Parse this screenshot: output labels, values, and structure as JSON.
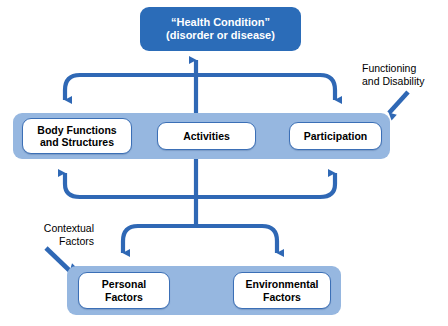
{
  "diagram": {
    "title_box": {
      "line1": "“Health Condition”",
      "line2": "(disorder or disease)"
    },
    "middle_band": {
      "nodes": [
        {
          "line1": "Body Functions",
          "line2": "and Structures"
        },
        {
          "line1": "Activities",
          "line2": ""
        },
        {
          "line1": "Participation",
          "line2": ""
        }
      ]
    },
    "bottom_band": {
      "nodes": [
        {
          "line1": "Personal",
          "line2": "Factors"
        },
        {
          "line1": "Environmental",
          "line2": "Factors"
        }
      ]
    },
    "labels": {
      "functioning": {
        "line1": "Functioning",
        "line2": "and Disability"
      },
      "contextual": {
        "line1": "Contextual",
        "line2": "Factors"
      }
    },
    "colors": {
      "health_box_fill": "#2b6cb8",
      "band_fill": "#96b7e0",
      "node_fill": "#ffffff",
      "node_border": "#3b6fb6",
      "connector_stroke": "#2f68b5",
      "label_text": "#000000",
      "health_box_text": "#ffffff",
      "background": "#ffffff"
    },
    "connectors": [
      {
        "name": "up-arrow-to-health-condition",
        "direction": "up"
      },
      {
        "name": "down-arrow-left-to-body-functions",
        "direction": "down"
      },
      {
        "name": "down-arrow-right-to-participation",
        "direction": "down"
      },
      {
        "name": "up-arrow-left-from-body-functions",
        "direction": "up"
      },
      {
        "name": "up-arrow-right-from-participation",
        "direction": "up"
      },
      {
        "name": "down-arrow-to-personal-factors",
        "direction": "down"
      },
      {
        "name": "down-arrow-to-environmental-factors",
        "direction": "down"
      },
      {
        "name": "pointer-functioning-and-disability",
        "direction": "down-left"
      },
      {
        "name": "pointer-contextual-factors",
        "direction": "down-right"
      }
    ]
  }
}
